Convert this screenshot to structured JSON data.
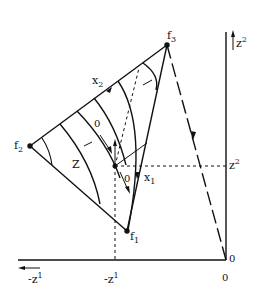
{
  "figure": {
    "points": {
      "f1": "f",
      "f1_sub": "1",
      "f2": "f",
      "f2_sub": "2",
      "f3": "f",
      "f3_sub": "3"
    },
    "labels": {
      "x1": "x",
      "x1_sub": "1",
      "x2": "x",
      "x2_sub": "2",
      "z": "Z",
      "zero_upper": "0",
      "zero_lower": "0"
    },
    "axes": {
      "z2_top": "z",
      "z2_top_sup": "2",
      "z2_mid": "z",
      "z2_mid_sup": "2",
      "neg_z1_left": "-z",
      "neg_z1_left_sup": "1",
      "neg_z1_mid": "-z",
      "neg_z1_mid_sup": "1",
      "origin_right": "0",
      "origin_bottom": "0"
    },
    "colors": {
      "ink": "#111111",
      "background": "#ffffff"
    }
  }
}
